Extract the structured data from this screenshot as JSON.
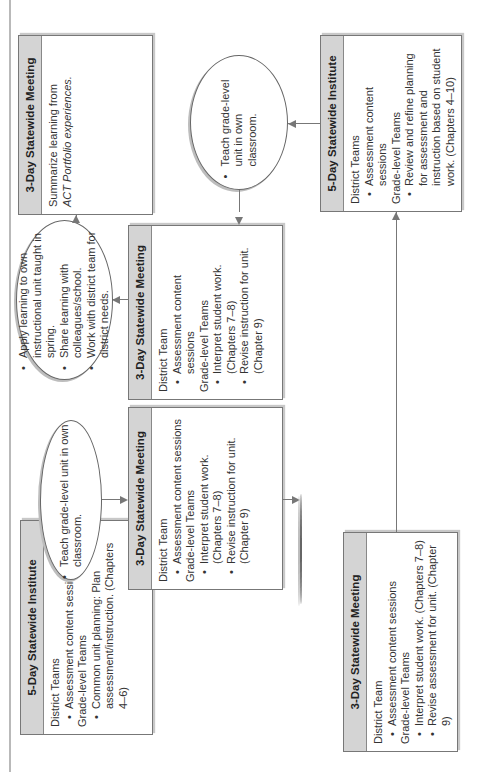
{
  "diagram": {
    "orientation": "rotated -90 degrees (landscape page printed sideways)",
    "nodes": {
      "institute_a": {
        "title": "5-Day Statewide Institute",
        "groups": [
          {
            "label": "District Teams",
            "items": [
              "Assessment content sessions"
            ]
          },
          {
            "label": "Grade-level Teams",
            "items": [
              "Common unit planning: Plan assessment/instruction. (Chapters 4–6)"
            ]
          }
        ]
      },
      "oval_teach_a": {
        "items": [
          "Teach grade-level unit in own classroom."
        ]
      },
      "meeting_b": {
        "title": "3-Day Statewide Meeting",
        "groups": [
          {
            "label": "District Team",
            "items": [
              "Assessment content sessions"
            ]
          },
          {
            "label": "Grade-level Teams",
            "items": [
              "Interpret student work. (Chapters 7–8)",
              "Revise instruction for unit. (Chapter 9)"
            ]
          }
        ]
      },
      "oval_share_b": {
        "items": [
          "Share learning with department/school.",
          "Work with district team for district needs."
        ]
      },
      "meeting_c": {
        "title": "3-Day Statewide Meeting",
        "groups": [
          {
            "label": "District Team",
            "items": [
              "Assessment content sessions"
            ]
          },
          {
            "label": "Grade-level Teams",
            "items": [
              "Interpret student work. (Chapters 7–8)",
              "Revise assessment for unit. (Chapter 9)"
            ]
          }
        ]
      },
      "meeting_d": {
        "title": "3-Day Statewide Meeting",
        "groups": [
          {
            "label": "District Team",
            "items": [
              "Assessment content sessions"
            ]
          },
          {
            "label": "Grade-level Teams",
            "items": [
              "Interpret student work. (Chapters 7–8)",
              "Revise instruction for unit. (Chapter 9)"
            ]
          }
        ]
      },
      "oval_apply": {
        "items": [
          "Apply learning to own instructional unit taught in spring.",
          "Share learning with colleagues/school.",
          "Work with district team for district needs."
        ]
      },
      "meeting_e": {
        "title": "3-Day Statewide Meeting",
        "text_line1": "Summarize learning from",
        "text_line2": "ACT Portfolio experiences."
      },
      "oval_teach_f": {
        "items": [
          "Teach grade-level unit in own classroom."
        ]
      },
      "institute_g": {
        "title": "5-Day Statewide Institute",
        "groups": [
          {
            "label": "District Teams",
            "items": [
              "Assessment content sessions"
            ]
          },
          {
            "label": "Grade-level Teams",
            "items": [
              "Review and refine planning for assessment and instruction based on student work. (Chapters 4–10)"
            ]
          }
        ]
      }
    },
    "colors": {
      "header_fill": "#d4d4d4",
      "border": "#777777",
      "text": "#333333"
    }
  }
}
